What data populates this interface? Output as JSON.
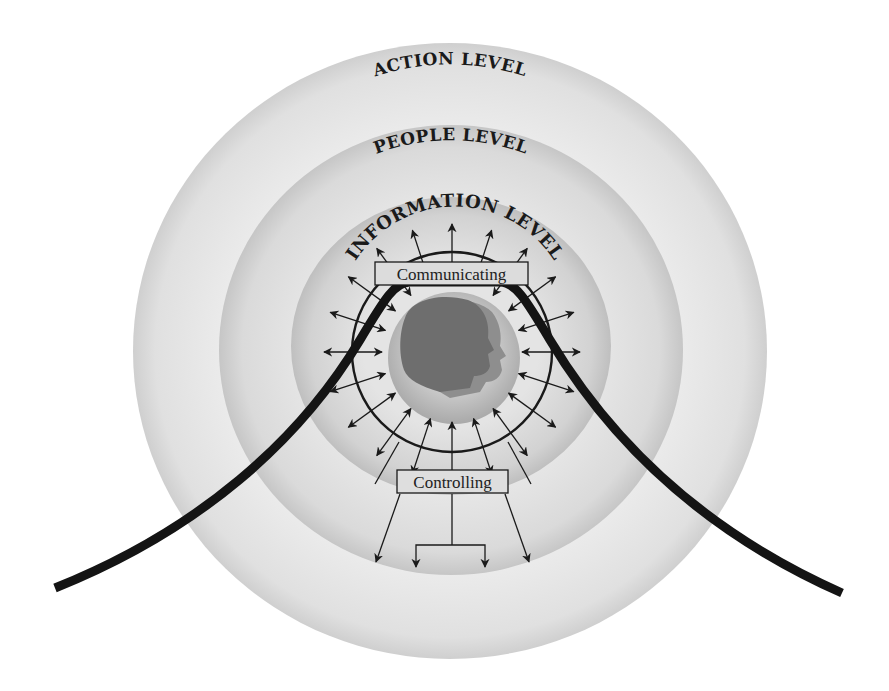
{
  "diagram": {
    "levels": [
      {
        "id": "action",
        "label": "ACTION LEVEL"
      },
      {
        "id": "people",
        "label": "PEOPLE LEVEL"
      },
      {
        "id": "information",
        "label": "INFORMATION LEVEL"
      }
    ],
    "boxes": {
      "communicating": "Communicating",
      "controlling": "Controlling"
    },
    "center_icon": "person-head-icon",
    "colors": {
      "outer_ring": "#e9e9e9",
      "middle_ring": "#e2e2e2",
      "inner_ring": "#dadada",
      "head_disk": "#bdbdbd",
      "head": "#6e6e6e",
      "head_shadow": "#8e8e8e",
      "curve": "#141414"
    }
  }
}
